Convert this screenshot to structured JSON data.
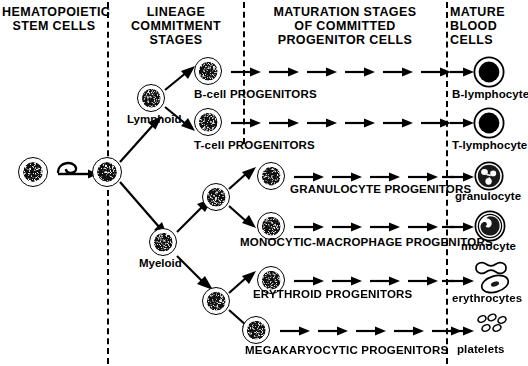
{
  "headers": {
    "stem": "HEMATOPOIETIC\nSTEM CELLS",
    "lineage": "LINEAGE\nCOMMITMENT\nSTAGES",
    "maturation": "MATURATION STAGES\nOF COMMITTED\nPROGENITOR CELLS",
    "mature": "MATURE\nBLOOD\nCELLS"
  },
  "lineage_nodes": {
    "lymphoid": "Lymphoid",
    "myeloid": "Myeloid"
  },
  "progenitors": [
    {
      "label": "B-cell  PROGENITORS",
      "arrows": 6
    },
    {
      "label": "T-cell  PROGENITORS",
      "arrows": 6
    },
    {
      "label": "GRANULOCYTE PROGENITORS",
      "arrows": 5
    },
    {
      "label": "MONOCYTIC-MACROPHAGE PROGENITORS",
      "arrows": 5
    },
    {
      "label": "ERYTHROID PROGENITORS",
      "arrows": 5
    },
    {
      "label": "MEGAKARYOCYTIC PROGENITORS",
      "arrows": 5
    }
  ],
  "mature_cells": [
    {
      "label": "B-lymphocyte",
      "glyph": "lymphocyte-cell-icon"
    },
    {
      "label": "T-lymphocyte",
      "glyph": "lymphocyte-cell-icon"
    },
    {
      "label": "granulocyte",
      "glyph": "granulocyte-cell-icon"
    },
    {
      "label": "monocyte",
      "glyph": "monocyte-cell-icon"
    },
    {
      "label": "erythrocytes",
      "glyph": "erythrocyte-cell-icon"
    },
    {
      "label": "platelets",
      "glyph": "platelet-icon"
    }
  ],
  "colors": {
    "ink": "#000000",
    "paper": "#ffffff"
  }
}
